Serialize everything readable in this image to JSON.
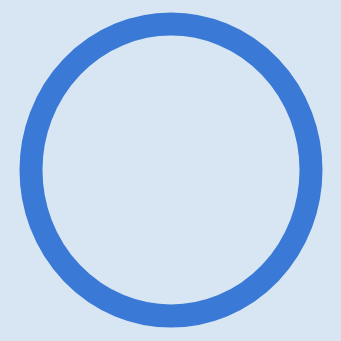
{
  "canvas": {
    "width": 341,
    "height": 341,
    "background_color": "#d8e6f3"
  },
  "ring": {
    "shape": "circle-outline",
    "center_x": 171,
    "center_y": 170,
    "radius": 140,
    "radius_x": 140,
    "radius_y": 146,
    "stroke_width": 23,
    "stroke_color": "#3a7ad6",
    "fill": "none"
  }
}
